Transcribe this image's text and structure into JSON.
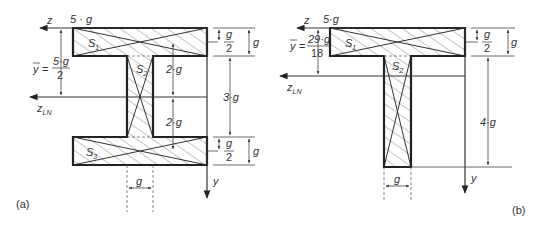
{
  "figure": {
    "panels": [
      {
        "id": "a",
        "caption": "(a)",
        "shape": "I-section",
        "axes": {
          "z": "z",
          "z_ln": "z",
          "z_ln_sub": "LN",
          "y": "y"
        },
        "top_width_label": "5 · g",
        "centroid_label": {
          "ybar": "y",
          "eq": "=",
          "num": "5·g",
          "den": "2"
        },
        "areas": [
          {
            "name": "S",
            "sub": "1"
          },
          {
            "name": "S",
            "sub": "2"
          },
          {
            "name": "S",
            "sub": "3"
          }
        ],
        "dimensions": {
          "top_half": {
            "num": "g",
            "den": "2"
          },
          "top_flange": "g",
          "web_upper": "2·g",
          "web_lower": "2·g",
          "web_height": "3·g",
          "bottom_half": {
            "num": "g",
            "den": "2"
          },
          "bottom_flange": "g",
          "web_width": "g"
        }
      },
      {
        "id": "b",
        "caption": "(b)",
        "shape": "T-section",
        "axes": {
          "z": "z",
          "z_ln": "z",
          "z_ln_sub": "LN",
          "y": "y"
        },
        "top_width_label": "5·g",
        "centroid_label": {
          "ybar": "y",
          "eq": "=",
          "num": "29·g",
          "den": "18"
        },
        "areas": [
          {
            "name": "S",
            "sub": "1"
          },
          {
            "name": "S",
            "sub": "2"
          }
        ],
        "dimensions": {
          "top_half": {
            "num": "g",
            "den": "2"
          },
          "top_flange": "g",
          "web_height": "4·g",
          "web_width": "g"
        }
      }
    ]
  }
}
